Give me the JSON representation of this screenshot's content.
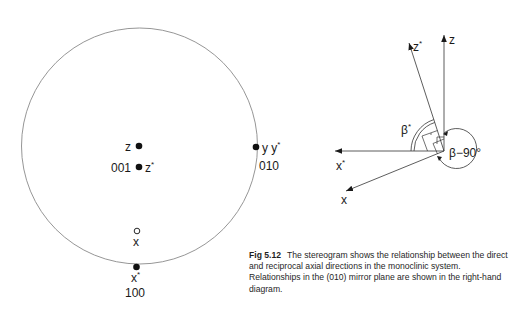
{
  "stereogram": {
    "poles": [
      {
        "id": "z",
        "label": "z",
        "filled": true
      },
      {
        "id": "001",
        "label_left": "001",
        "label_right": "z",
        "label_right_sup": "*",
        "filled": true
      },
      {
        "id": "010",
        "label_right": "y y",
        "label_right_sup": "*",
        "label_below": "010",
        "filled": true
      },
      {
        "id": "x",
        "label_below": "x",
        "filled": false
      },
      {
        "id": "100",
        "label_below": "x",
        "label_below_sup": "*",
        "label_below2": "100",
        "filled": true
      }
    ]
  },
  "axes_diagram": {
    "z_label": "z",
    "zstar_label": "z",
    "zstar_sup": "*",
    "xstar_label": "x",
    "xstar_sup": "*",
    "x_label": "x",
    "beta_star_label": "β",
    "beta_star_sup": "*",
    "beta_minus_90_label": "β−90°"
  },
  "caption": {
    "figure_number": "Fig 5.12",
    "text": "The stereogram shows the relationship between the direct and reciprocal axial directions in the monoclinic system. Relationships in the (010) mirror plane are shown in the right-hand diagram."
  }
}
